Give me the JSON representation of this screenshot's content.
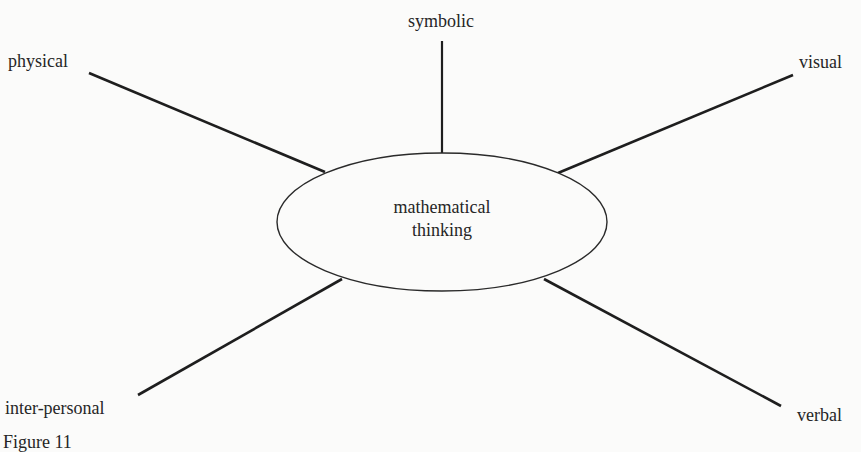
{
  "diagram": {
    "center": {
      "line1": "mathematical",
      "line2": "thinking"
    },
    "nodes": [
      {
        "id": "symbolic",
        "label": "symbolic"
      },
      {
        "id": "physical",
        "label": "physical"
      },
      {
        "id": "visual",
        "label": "visual"
      },
      {
        "id": "inter-personal",
        "label": "inter-personal"
      },
      {
        "id": "verbal",
        "label": "verbal"
      }
    ],
    "caption": "Figure 11"
  }
}
